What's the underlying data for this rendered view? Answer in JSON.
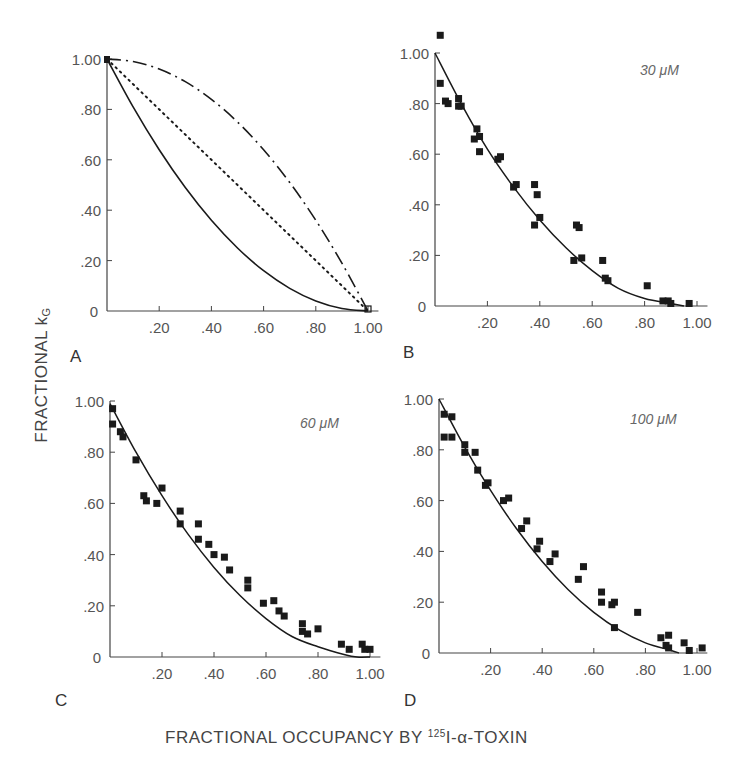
{
  "chart_data": [
    {
      "panel": "A",
      "type": "line",
      "title": "",
      "xlabel": "FRACTIONAL OCCUPANCY BY 125I-α-TOXIN",
      "ylabel": "FRACTIONAL kG",
      "xlim": [
        0,
        1.0
      ],
      "ylim": [
        0,
        1.0
      ],
      "x_ticks": [
        ".20",
        ".40",
        ".60",
        ".80",
        "1.00"
      ],
      "y_ticks": [
        "0",
        ".20",
        ".40",
        ".60",
        ".80",
        "1.00"
      ],
      "grid": false,
      "series": [
        {
          "name": "solid curve (concave up)",
          "style": "solid",
          "x": [
            0,
            0.1,
            0.2,
            0.3,
            0.4,
            0.5,
            0.6,
            0.7,
            0.8,
            0.9,
            1.0
          ],
          "y": [
            1.0,
            0.81,
            0.64,
            0.49,
            0.36,
            0.25,
            0.16,
            0.09,
            0.04,
            0.01,
            0.0
          ]
        },
        {
          "name": "dotted line (linear)",
          "style": "dotted",
          "x": [
            0,
            1.0
          ],
          "y": [
            1.0,
            0.0
          ]
        },
        {
          "name": "dash-dot curve (concave down)",
          "style": "dashdot",
          "x": [
            0,
            0.1,
            0.2,
            0.3,
            0.4,
            0.5,
            0.6,
            0.7,
            0.8,
            0.9,
            1.0
          ],
          "y": [
            1.0,
            0.99,
            0.96,
            0.91,
            0.84,
            0.75,
            0.64,
            0.51,
            0.36,
            0.19,
            0.0
          ]
        }
      ]
    },
    {
      "panel": "B",
      "type": "scatter",
      "annotation": "30 μM",
      "xlim": [
        0,
        1.0
      ],
      "ylim": [
        0,
        1.0
      ],
      "x_ticks": [
        ".20",
        ".40",
        ".60",
        ".80",
        "1.00"
      ],
      "y_ticks": [
        "0",
        ".20",
        ".40",
        ".60",
        ".80",
        "1.00"
      ],
      "fit": {
        "style": "solid",
        "x": [
          0,
          0.1,
          0.2,
          0.3,
          0.4,
          0.5,
          0.6,
          0.7,
          0.8,
          0.9,
          0.95
        ],
        "y": [
          1.0,
          0.8,
          0.62,
          0.47,
          0.34,
          0.23,
          0.14,
          0.07,
          0.03,
          0.01,
          0.0
        ]
      },
      "points": {
        "x": [
          0.02,
          0.02,
          0.04,
          0.05,
          0.09,
          0.09,
          0.1,
          0.15,
          0.16,
          0.17,
          0.17,
          0.24,
          0.25,
          0.3,
          0.31,
          0.38,
          0.39,
          0.38,
          0.4,
          0.54,
          0.55,
          0.53,
          0.56,
          0.64,
          0.65,
          0.66,
          0.81,
          0.87,
          0.89,
          0.9,
          0.97
        ],
        "y": [
          1.07,
          0.88,
          0.81,
          0.8,
          0.82,
          0.79,
          0.79,
          0.66,
          0.7,
          0.67,
          0.61,
          0.58,
          0.59,
          0.47,
          0.48,
          0.48,
          0.44,
          0.32,
          0.35,
          0.32,
          0.31,
          0.18,
          0.19,
          0.18,
          0.11,
          0.1,
          0.08,
          0.02,
          0.02,
          0.01,
          0.01
        ]
      }
    },
    {
      "panel": "C",
      "type": "scatter",
      "annotation": "60 μM",
      "xlim": [
        0,
        1.0
      ],
      "ylim": [
        0,
        1.0
      ],
      "x_ticks": [
        ".20",
        ".40",
        ".60",
        ".80",
        "1.00"
      ],
      "y_ticks": [
        "0",
        ".20",
        ".40",
        ".60",
        ".80",
        "1.00"
      ],
      "fit": {
        "style": "solid",
        "x": [
          0,
          0.1,
          0.2,
          0.3,
          0.4,
          0.5,
          0.6,
          0.7,
          0.8,
          0.9,
          0.95,
          1.0
        ],
        "y": [
          0.99,
          0.8,
          0.63,
          0.48,
          0.35,
          0.24,
          0.15,
          0.08,
          0.04,
          0.01,
          0.0,
          0.0
        ]
      },
      "points": {
        "x": [
          0.01,
          0.01,
          0.04,
          0.05,
          0.1,
          0.13,
          0.14,
          0.18,
          0.2,
          0.27,
          0.27,
          0.34,
          0.34,
          0.38,
          0.4,
          0.44,
          0.46,
          0.53,
          0.53,
          0.59,
          0.63,
          0.65,
          0.67,
          0.74,
          0.74,
          0.76,
          0.8,
          0.89,
          0.92,
          0.97,
          0.98,
          1.0
        ],
        "y": [
          0.97,
          0.91,
          0.88,
          0.86,
          0.77,
          0.63,
          0.61,
          0.6,
          0.66,
          0.57,
          0.52,
          0.52,
          0.46,
          0.44,
          0.4,
          0.39,
          0.34,
          0.3,
          0.27,
          0.21,
          0.22,
          0.18,
          0.16,
          0.13,
          0.1,
          0.09,
          0.11,
          0.05,
          0.03,
          0.05,
          0.03,
          0.03
        ]
      }
    },
    {
      "panel": "D",
      "type": "scatter",
      "annotation": "100 μM",
      "xlim": [
        0,
        1.0
      ],
      "ylim": [
        0,
        1.0
      ],
      "x_ticks": [
        ".20",
        ".40",
        ".60",
        ".80",
        "1.00"
      ],
      "y_ticks": [
        "0",
        ".20",
        ".40",
        ".60",
        ".80",
        "1.00"
      ],
      "fit": {
        "style": "solid",
        "x": [
          0,
          0.1,
          0.2,
          0.3,
          0.4,
          0.5,
          0.6,
          0.7,
          0.8,
          0.9,
          0.93
        ],
        "y": [
          1.0,
          0.81,
          0.64,
          0.49,
          0.36,
          0.25,
          0.16,
          0.09,
          0.04,
          0.01,
          0.0
        ]
      },
      "points": {
        "x": [
          0.02,
          0.02,
          0.05,
          0.05,
          0.1,
          0.1,
          0.14,
          0.15,
          0.18,
          0.19,
          0.25,
          0.27,
          0.32,
          0.34,
          0.38,
          0.39,
          0.43,
          0.45,
          0.54,
          0.56,
          0.63,
          0.63,
          0.67,
          0.68,
          0.68,
          0.77,
          0.86,
          0.88,
          0.89,
          0.89,
          0.95,
          0.97,
          1.02
        ],
        "y": [
          0.94,
          0.85,
          0.93,
          0.85,
          0.82,
          0.79,
          0.79,
          0.72,
          0.66,
          0.67,
          0.6,
          0.61,
          0.49,
          0.52,
          0.41,
          0.44,
          0.36,
          0.39,
          0.29,
          0.34,
          0.24,
          0.2,
          0.19,
          0.2,
          0.1,
          0.16,
          0.06,
          0.03,
          0.07,
          0.02,
          0.04,
          0.01,
          0.02
        ]
      }
    }
  ],
  "labels": {
    "y_axis_main": "FRACTIONAL k",
    "y_axis_sub": "G",
    "x_axis_pre": "FRACTIONAL OCCUPANCY BY ",
    "x_axis_sup": "125",
    "x_axis_post": "I-α-TOXIN"
  },
  "layout": {
    "panels": [
      {
        "ox": 107,
        "oy": 311,
        "w": 261,
        "h": 252,
        "letter_x": 70,
        "letter_y": 362,
        "conc_x": 0,
        "conc_y": 0,
        "zero_x": 90
      },
      {
        "ox": 435,
        "oy": 306,
        "w": 262,
        "h": 253,
        "letter_x": 403,
        "letter_y": 358,
        "conc_x": 640,
        "conc_y": 75,
        "zero_x": 418
      },
      {
        "ox": 110,
        "oy": 657,
        "w": 260,
        "h": 256,
        "letter_x": 55,
        "letter_y": 706,
        "conc_x": 300,
        "conc_y": 428,
        "zero_x": 93
      },
      {
        "ox": 439,
        "oy": 653,
        "w": 258,
        "h": 254,
        "letter_x": 404,
        "letter_y": 706,
        "conc_x": 630,
        "conc_y": 424,
        "zero_x": 422
      }
    ],
    "ink": "#1a1a1a",
    "axis": "#444444"
  }
}
